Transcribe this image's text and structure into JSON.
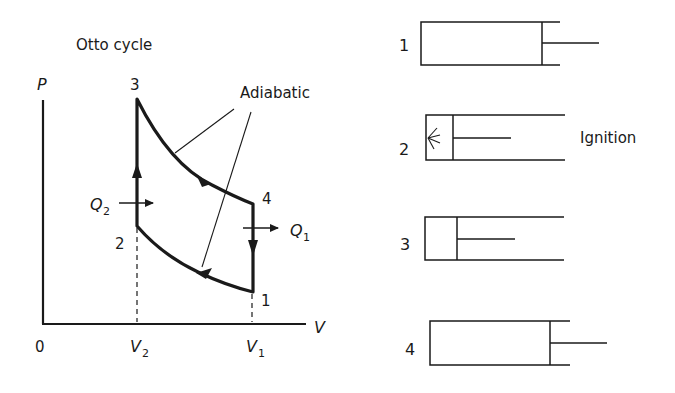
{
  "title": "Otto cycle",
  "axes": {
    "y_label": "P",
    "x_label": "V",
    "origin_label": "0",
    "x_ticks": [
      {
        "label": "V",
        "sub": "2"
      },
      {
        "label": "V",
        "sub": "1"
      }
    ]
  },
  "states": [
    "1",
    "2",
    "3",
    "4"
  ],
  "annotations": {
    "adiabatic": "Adiabatic",
    "heat_in": {
      "label": "Q",
      "sub": "2"
    },
    "heat_out": {
      "label": "Q",
      "sub": "1"
    }
  },
  "pistons": [
    {
      "label": "1",
      "caption": ""
    },
    {
      "label": "2",
      "caption": "Ignition"
    },
    {
      "label": "3",
      "caption": ""
    },
    {
      "label": "4",
      "caption": ""
    }
  ],
  "colors": {
    "ink": "#1a1a1a",
    "background": "#ffffff"
  }
}
